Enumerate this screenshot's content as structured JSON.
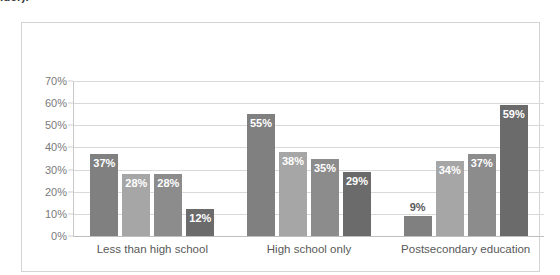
{
  "top_fragment": "lder).",
  "chart_data": {
    "type": "bar",
    "title": "",
    "xlabel": "",
    "ylabel": "",
    "ylim": [
      0,
      70
    ],
    "grid": true,
    "legend_position": "bottom",
    "categories": [
      "Less than high school",
      "High school only",
      "Postsecondary education"
    ],
    "ytick_labels": [
      "70%",
      "60%",
      "50%",
      "40%",
      "30%",
      "20%",
      "10%",
      "0%"
    ],
    "ytick_values": [
      70,
      60,
      50,
      40,
      30,
      20,
      10,
      0
    ],
    "series": [
      {
        "name": "TANF",
        "color": "#808080",
        "values": [
          37,
          55,
          9
        ],
        "labels": [
          "37%",
          "55%",
          "9%"
        ]
      },
      {
        "name": "SNAP Work Registrants",
        "color": "#a6a6a6",
        "values": [
          28,
          38,
          34
        ],
        "labels": [
          "28%",
          "38%",
          "34%"
        ]
      },
      {
        "name": "Low Income Adults",
        "color": "#8c8c8c",
        "values": [
          28,
          35,
          37
        ],
        "labels": [
          "28%",
          "35%",
          "37%"
        ]
      },
      {
        "name": "U.S. Population",
        "color": "#6b6b6b",
        "values": [
          12,
          29,
          59
        ],
        "labels": [
          "12%",
          "29%",
          "59%"
        ]
      }
    ]
  }
}
